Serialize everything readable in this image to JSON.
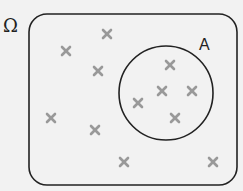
{
  "diagram": {
    "universe_label": "Ω",
    "set_label": "A",
    "colors": {
      "background": "#f2f2f2",
      "outline": "#222222",
      "marker": "#999999"
    },
    "universe_rect": {
      "x": 29,
      "y": 14,
      "w": 208,
      "h": 171,
      "r": 18
    },
    "set_circle": {
      "cx": 166,
      "cy": 93,
      "r": 47
    },
    "points_outside_A": [
      {
        "x": 107,
        "y": 34
      },
      {
        "x": 66,
        "y": 51
      },
      {
        "x": 98,
        "y": 71
      },
      {
        "x": 51,
        "y": 118
      },
      {
        "x": 95,
        "y": 130
      },
      {
        "x": 124,
        "y": 162
      },
      {
        "x": 213,
        "y": 162
      }
    ],
    "points_inside_A": [
      {
        "x": 170,
        "y": 65
      },
      {
        "x": 162,
        "y": 91
      },
      {
        "x": 192,
        "y": 91
      },
      {
        "x": 138,
        "y": 103
      },
      {
        "x": 175,
        "y": 118
      }
    ],
    "marker": "×"
  }
}
